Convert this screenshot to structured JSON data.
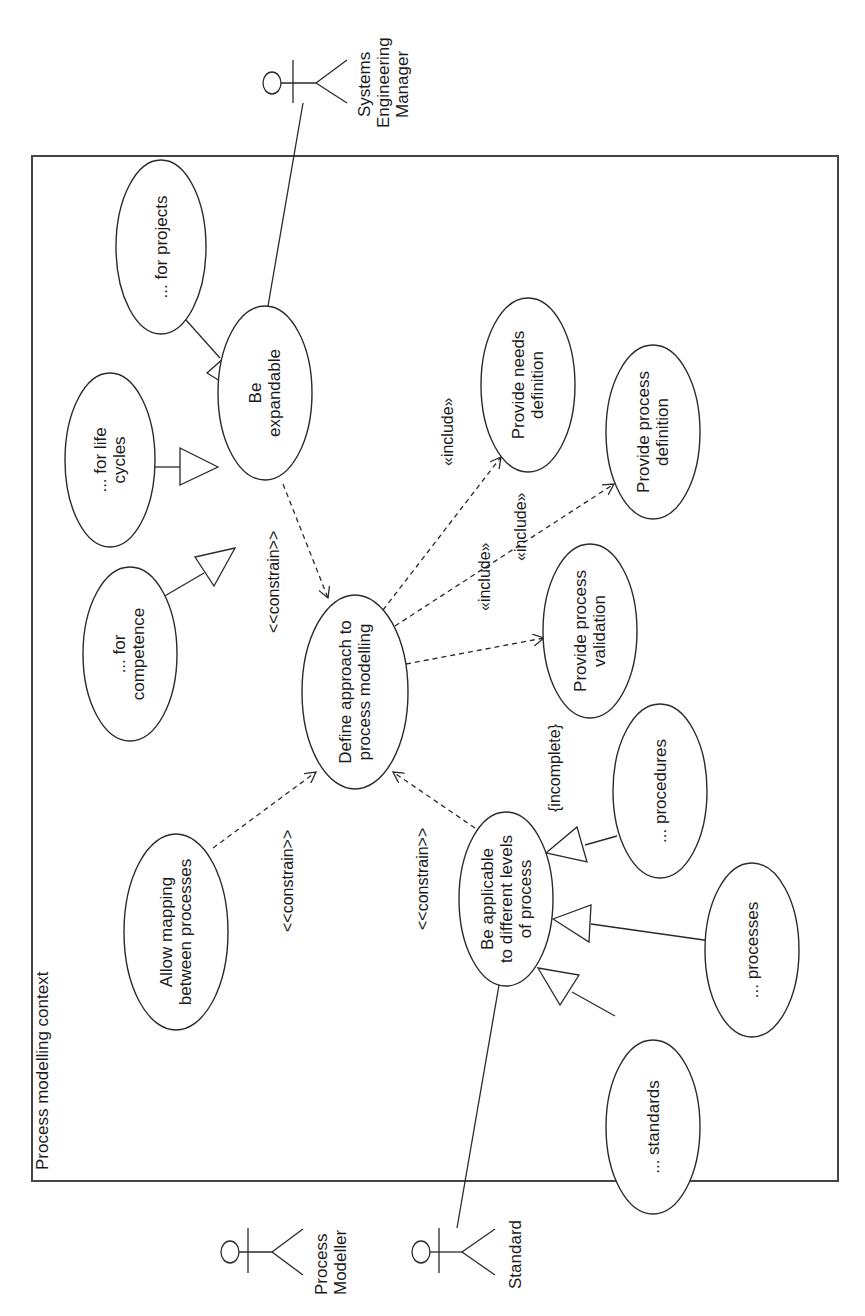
{
  "diagram": {
    "type": "UML use case diagram",
    "orientation": "rotated 90deg counter-clockwise",
    "frame_title": "Process modelling context",
    "actors": [
      {
        "id": "sem",
        "name": "Systems Engineering Manager",
        "lines": [
          "Systems",
          "Engineering",
          "Manager"
        ]
      },
      {
        "id": "pm",
        "name": "Process Modeller",
        "lines": [
          "Process",
          "Modeller"
        ]
      },
      {
        "id": "std",
        "name": "Standard",
        "lines": [
          "Standard"
        ]
      }
    ],
    "use_cases": [
      {
        "id": "projects",
        "lines": [
          "... for projects"
        ]
      },
      {
        "id": "lifecycles",
        "lines": [
          "... for life",
          "cycles"
        ]
      },
      {
        "id": "competence",
        "lines": [
          "... for",
          "competence"
        ]
      },
      {
        "id": "expandable",
        "lines": [
          "Be",
          "expandable"
        ]
      },
      {
        "id": "define",
        "lines": [
          "Define approach to",
          "process modelling"
        ]
      },
      {
        "id": "needs",
        "lines": [
          "Provide needs",
          "definition"
        ]
      },
      {
        "id": "procdef",
        "lines": [
          "Provide process",
          "definition"
        ]
      },
      {
        "id": "procval",
        "lines": [
          "Provide process",
          "validation"
        ]
      },
      {
        "id": "mapping",
        "lines": [
          "Allow mapping",
          "between processes"
        ]
      },
      {
        "id": "applicable",
        "lines": [
          "Be applicable",
          "to different levels",
          "of process"
        ]
      },
      {
        "id": "procedures",
        "lines": [
          "... procedures"
        ]
      },
      {
        "id": "processes",
        "lines": [
          "... processes"
        ]
      },
      {
        "id": "standards",
        "lines": [
          "... standards"
        ]
      }
    ],
    "relationships": [
      {
        "from": "projects",
        "to": "expandable",
        "type": "generalization"
      },
      {
        "from": "lifecycles",
        "to": "expandable",
        "type": "generalization"
      },
      {
        "from": "competence",
        "to": "expandable",
        "type": "generalization"
      },
      {
        "from": "expandable",
        "to": "define",
        "type": "dependency",
        "label": "<<constrain>>"
      },
      {
        "from": "mapping",
        "to": "define",
        "type": "dependency",
        "label": "<<constrain>>"
      },
      {
        "from": "applicable",
        "to": "define",
        "type": "dependency",
        "label": "<<constrain>>"
      },
      {
        "from": "define",
        "to": "needs",
        "type": "dependency",
        "label": "«include»"
      },
      {
        "from": "define",
        "to": "procdef",
        "type": "dependency",
        "label": "«include»"
      },
      {
        "from": "define",
        "to": "procval",
        "type": "dependency",
        "label": "«include»"
      },
      {
        "from": "procedures",
        "to": "applicable",
        "type": "generalization"
      },
      {
        "from": "processes",
        "to": "applicable",
        "type": "generalization"
      },
      {
        "from": "standards",
        "to": "applicable",
        "type": "generalization"
      },
      {
        "from": "sem",
        "to": "expandable",
        "type": "association"
      },
      {
        "from": "std",
        "to": "applicable",
        "type": "association"
      }
    ],
    "constraint_note": "{incomplete}",
    "labels": {
      "constrain": "<<constrain>>",
      "include": "«include»",
      "incomplete": "{incomplete}"
    },
    "colors": {
      "line": "#2a2a2a",
      "frame": "#444444",
      "background": "#ffffff"
    }
  }
}
